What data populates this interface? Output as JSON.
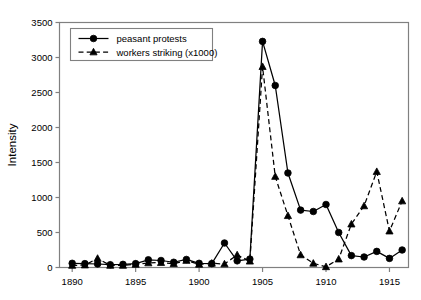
{
  "chart_data": {
    "type": "line",
    "title": "",
    "xlabel": "",
    "ylabel": "Intensity",
    "xlim": [
      1889,
      1916.5
    ],
    "ylim": [
      0,
      3500
    ],
    "ytick_step": 500,
    "yticks": [
      "0",
      "500",
      "1000",
      "1500",
      "2000",
      "2500",
      "3000",
      "3500"
    ],
    "xticks": [
      "1890",
      "1895",
      "1900",
      "1905",
      "1910",
      "1915"
    ],
    "xtick_values": [
      1890,
      1895,
      1900,
      1905,
      1910,
      1915
    ],
    "grid": false,
    "legend_position": "top-left",
    "x": [
      1890,
      1891,
      1892,
      1893,
      1894,
      1895,
      1896,
      1897,
      1898,
      1899,
      1900,
      1901,
      1902,
      1903,
      1904,
      1905,
      1906,
      1907,
      1908,
      1909,
      1910,
      1911,
      1912,
      1913,
      1914,
      1915,
      1916
    ],
    "series": [
      {
        "name": "peasant protests",
        "marker": "circle",
        "linestyle": "solid",
        "color": "#000000",
        "values": [
          60,
          55,
          50,
          40,
          45,
          55,
          110,
          100,
          75,
          115,
          60,
          55,
          350,
          95,
          120,
          3230,
          2600,
          1350,
          820,
          800,
          900,
          500,
          170,
          150,
          230,
          130,
          250
        ]
      },
      {
        "name": "workers striking (x1000)",
        "marker": "triangle",
        "linestyle": "dashed",
        "color": "#000000",
        "values": [
          30,
          35,
          130,
          30,
          30,
          45,
          65,
          70,
          55,
          100,
          45,
          60,
          50,
          180,
          90,
          2870,
          1300,
          740,
          180,
          60,
          10,
          120,
          620,
          880,
          1370,
          520,
          950
        ]
      }
    ]
  },
  "legend": {
    "items": [
      {
        "label": "peasant protests"
      },
      {
        "label": "workers striking (x1000)"
      }
    ]
  },
  "axes": {
    "y_title": "Intensity"
  }
}
